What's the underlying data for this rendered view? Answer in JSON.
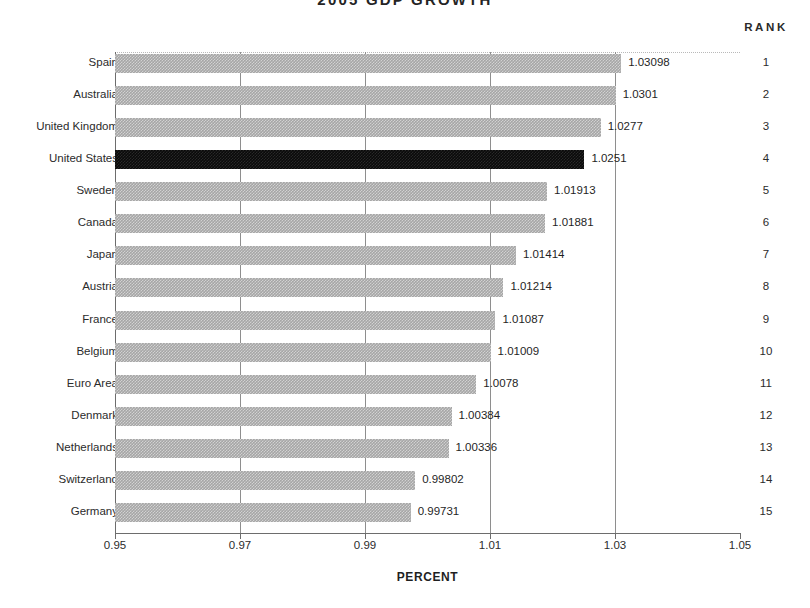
{
  "chart_data": {
    "type": "bar",
    "orientation": "horizontal",
    "title": "2005  GDP  GROWTH",
    "xlabel": "PERCENT",
    "ylabel": "",
    "xlim": [
      0.95,
      1.05
    ],
    "xticks": [
      "0.95",
      "0.97",
      "0.99",
      "1.01",
      "1.03",
      "1.05"
    ],
    "xtick_values": [
      0.95,
      0.97,
      0.99,
      1.01,
      1.03,
      1.05
    ],
    "grid": true,
    "grid_axis": "x",
    "legend": "none",
    "rank_header": "RANK",
    "highlight_category": "United States",
    "colors": {
      "bar": "#a6a6a6",
      "highlight_bar": "#0a0a0a",
      "axis": "#6d6d6d",
      "grid": "#8e8e8e",
      "text": "#1f1f1f"
    },
    "categories": [
      "Spain",
      "Australia",
      "United Kingdom",
      "United States",
      "Sweden",
      "Canada",
      "Japan",
      "Austria",
      "France",
      "Belgium",
      "Euro Area",
      "Denmark",
      "Netherlands",
      "Switzerland",
      "Germany"
    ],
    "values": [
      1.03098,
      1.0301,
      1.0277,
      1.0251,
      1.01913,
      1.01881,
      1.01414,
      1.01214,
      1.01087,
      1.01009,
      1.0078,
      1.00384,
      1.00336,
      0.99802,
      0.99731
    ],
    "value_labels": [
      "1.03098",
      "1.0301",
      "1.0277",
      "1.0251",
      "1.01913",
      "1.01881",
      "1.01414",
      "1.01214",
      "1.01087",
      "1.01009",
      "1.0078",
      "1.00384",
      "1.00336",
      "0.99802",
      "0.99731"
    ],
    "ranks": [
      "1",
      "2",
      "3",
      "4",
      "5",
      "6",
      "7",
      "8",
      "9",
      "10",
      "11",
      "12",
      "13",
      "14",
      "15"
    ]
  }
}
